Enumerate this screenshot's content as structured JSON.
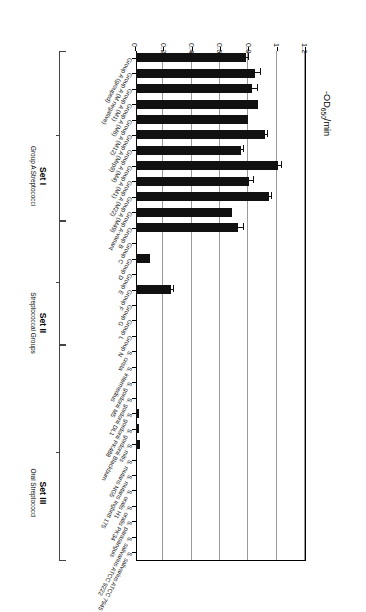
{
  "chart_data": {
    "type": "bar",
    "orientation": "horizontal",
    "title": "",
    "xlabel": "-OD650/min",
    "ylabel": "",
    "xlim": [
      0,
      1.2
    ],
    "grid": true,
    "legend": null,
    "axis_title_html": "-OD<sub>650</sub>/min",
    "tick_labels": [
      "1.2",
      "1",
      "0.8",
      "0.6",
      "0.4",
      "0.2",
      "0"
    ],
    "tick_values": [
      1.2,
      1.0,
      0.8,
      0.6,
      0.4,
      0.2,
      0
    ],
    "categories": [
      "Group A (grouped)",
      "Group A (M negative)",
      "Group A (M1)",
      "Group A (M6)",
      "Group A (M12)",
      "Group A (Mrp9)",
      "Group A (M4)",
      "Group A (M1)",
      "Group A (M22)",
      "Group A (M49)",
      "Group A-variant",
      "Group B",
      "Group C",
      "Group D",
      "Group E",
      "Group F",
      "Group G",
      "Group L",
      "Group N",
      "S. crista",
      "S. intermedius",
      "S. gordonii M5",
      "S. gordonii DL1",
      "S. gordonii PK488",
      "S. gordonii Blackburn",
      "S. mitis",
      "S. mutans NG5",
      "S. mutans Ingbritt 175",
      "S. oralis H1",
      "S. oralis PK34",
      "S. parasanguis",
      "S. salivarius ATCC 9222",
      "S. salivarius ATCC 7945"
    ],
    "values": [
      0.78,
      0.84,
      0.82,
      0.86,
      0.79,
      0.91,
      0.74,
      1.0,
      0.8,
      0.94,
      0.68,
      0.72,
      0.0,
      0.1,
      0.0,
      0.25,
      0.0,
      0.0,
      0.0,
      0.0,
      0.0,
      0.0,
      0.0,
      0.02,
      0.02,
      0.03,
      0.0,
      0.0,
      0.0,
      0.0,
      0.0,
      0.0,
      0.0
    ],
    "errors": [
      0.02,
      0.04,
      0.04,
      0.0,
      0.0,
      0.02,
      0.02,
      0.03,
      0.03,
      0.02,
      0.0,
      0.04,
      0.0,
      0.0,
      0.0,
      0.02,
      0.0,
      0.0,
      0.0,
      0.0,
      0.0,
      0.0,
      0.0,
      0.0,
      0.0,
      0.0,
      0.0,
      0.0,
      0.0,
      0.0,
      0.0,
      0.0,
      0.0
    ]
  },
  "sets": [
    {
      "title": "Set I",
      "subtitle": "Group A Streptococci",
      "start_index": 0,
      "end_index": 10
    },
    {
      "title": "Set II",
      "subtitle": "Streptococcal Groups",
      "start_index": 11,
      "end_index": 18
    },
    {
      "title": "Set III",
      "subtitle": "Oral Streptococci",
      "start_index": 19,
      "end_index": 32
    }
  ]
}
